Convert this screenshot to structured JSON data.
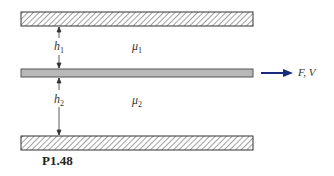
{
  "figure": {
    "label": "P1.48",
    "top_plate": {
      "type": "fixed-wall-hatched"
    },
    "middle_plate": {
      "type": "moving-plate",
      "fill": "#b8b8b8"
    },
    "bottom_plate": {
      "type": "fixed-wall-hatched"
    },
    "gap1": {
      "symbol": "h",
      "subscript": "1"
    },
    "gap2": {
      "symbol": "h",
      "subscript": "2"
    },
    "fluid1": {
      "symbol": "μ",
      "subscript": "1"
    },
    "fluid2": {
      "symbol": "μ",
      "subscript": "2"
    },
    "force_label": "F, V",
    "arrow_color": "#1a2a7a"
  }
}
